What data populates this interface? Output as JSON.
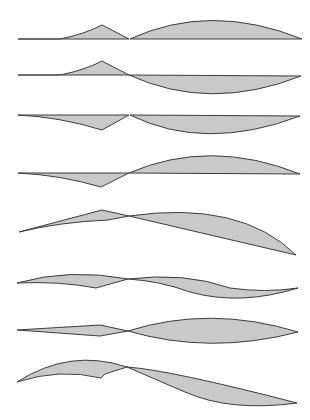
{
  "figure": {
    "width": 310,
    "height": 420,
    "colors": {
      "fill": "#c9c9c9",
      "stroke": "#3c3c3c",
      "background": "#ffffff"
    },
    "shapes": [
      {
        "id": "shape-1",
        "description": "left triangle bump above baseline, right convex arc above baseline",
        "left": "M18,39 L60,39 Q85,34 102,25 L129,39 Z",
        "right": "M130,39 Q210,2 302,39 L130,39 Z"
      },
      {
        "id": "shape-2",
        "description": "left triangle bump above baseline, right arc below baseline",
        "left": "M18,75 L60,75 Q85,70 102,61 L129,75 Z",
        "right": "M129,75 Q210,112 301,76 L129,75 Z"
      },
      {
        "id": "shape-3",
        "description": "left triangle dip below baseline, right arc below baseline",
        "left": "M18,115 Q60,117 102,130 L129,115 Z",
        "right": "M130,115 Q205,152 300,116 L130,115 Z"
      },
      {
        "id": "shape-4",
        "description": "left triangle dip below baseline, right arc above baseline",
        "left": "M18,173 Q60,175 101,187 L129,173 Z",
        "right": "M129,173 Q210,138 300,174 L129,173 Z"
      },
      {
        "id": "shape-5",
        "description": "rising left wedge, crossing, right crescent between arc and straight line",
        "left": "M19,232 L102,210 L129,216 L108,220 Q60,222 19,232 Z",
        "right": "M129,216 Q240,200 296,255 L129,216 Z"
      },
      {
        "id": "shape-6",
        "description": "S-shaped lens, left wedge and right wave",
        "left": "M17,283 Q70,268 128,279 L96,288 Q60,281 17,283 Z",
        "right": "M128,279 Q185,272 230,288 Q265,293 298,288 Q240,306 190,292 Q160,281 128,279 Z"
      },
      {
        "id": "shape-7",
        "description": "thin diamond on left, lens shape on right",
        "left": "M17,330 L100,325 L128,331 L100,336 Z",
        "right": "M128,331 Q210,305 298,332 Q210,355 128,331 Z"
      },
      {
        "id": "shape-8",
        "description": "hooked left arc, descending right crescent",
        "left": "M17,382 Q70,348 127,367 L105,374 L101,378 Q60,368 17,382 Z",
        "right": "M127,367 Q170,370 297,403 Q230,412 185,392 Q150,377 127,367 Z"
      }
    ]
  }
}
